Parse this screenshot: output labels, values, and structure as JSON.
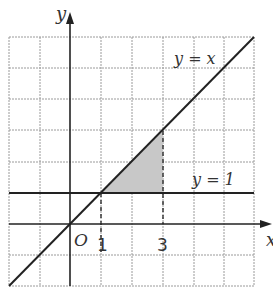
{
  "diagram": {
    "axes": {
      "x_label": "x",
      "y_label": "y",
      "origin_label": "O"
    },
    "lines": [
      {
        "label": "y = x",
        "equation": "y = x"
      },
      {
        "label": "y = 1",
        "equation": "y = 1"
      }
    ],
    "ticks": {
      "x": [
        "1",
        "3"
      ]
    },
    "shaded_region": "Region bounded by y = x, y = 1 and x = 3 (between x = 1 and x = 3)",
    "colors": {
      "grid": "#9a9a9a",
      "line": "#222222",
      "shade": "#c8c8c8"
    }
  }
}
